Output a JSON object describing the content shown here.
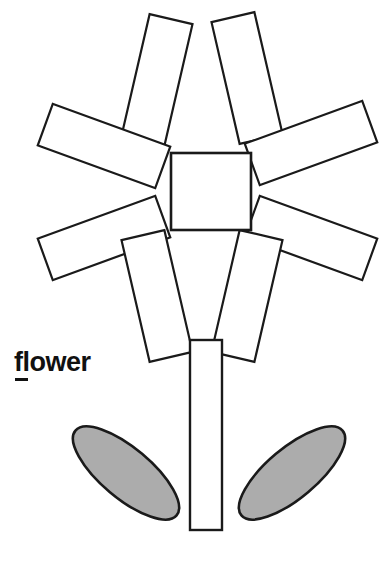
{
  "page": {
    "title": "flower",
    "background_color": "#ffffff",
    "width": 381,
    "height": 565
  },
  "label": {
    "text": "flower",
    "color": "#111111",
    "underlined_letter": "f",
    "style": "bold-sans-serif"
  },
  "drawing": {
    "name": "flower-line-drawing",
    "stroke_color": "#1a1a1a",
    "stroke_width": 2.2,
    "petal_fill": "#ffffff",
    "center_fill": "#ffffff",
    "stem_fill": "#ffffff",
    "leaf_fill": "#acacac",
    "petal_count": 8,
    "center": {
      "shape": "square",
      "x": 171,
      "y": 153,
      "width": 80,
      "height": 77
    },
    "petals": [
      {
        "name": "petal-top-left",
        "cx": 157,
        "cy": 80,
        "w": 44,
        "h": 125,
        "rotate": 13
      },
      {
        "name": "petal-top-right",
        "cx": 247,
        "cy": 78,
        "w": 44,
        "h": 125,
        "rotate": -13
      },
      {
        "name": "petal-upper-left",
        "cx": 104,
        "cy": 146,
        "w": 125,
        "h": 44,
        "rotate": 20
      },
      {
        "name": "petal-upper-right",
        "cx": 311,
        "cy": 143,
        "w": 125,
        "h": 44,
        "rotate": -20
      },
      {
        "name": "petal-lower-left",
        "cx": 104,
        "cy": 238,
        "w": 125,
        "h": 44,
        "rotate": -20
      },
      {
        "name": "petal-lower-right",
        "cx": 311,
        "cy": 238,
        "w": 125,
        "h": 44,
        "rotate": 20
      },
      {
        "name": "petal-bottom-left",
        "cx": 157,
        "cy": 296,
        "w": 44,
        "h": 125,
        "rotate": -13
      },
      {
        "name": "petal-bottom-right",
        "cx": 247,
        "cy": 296,
        "w": 44,
        "h": 125,
        "rotate": 13
      }
    ],
    "stem": {
      "name": "stem",
      "x": 190,
      "y": 340,
      "width": 32,
      "height": 190
    },
    "leaves": [
      {
        "name": "leaf-left",
        "cx": 126,
        "cy": 473,
        "rx": 66,
        "ry": 25,
        "rotate": 40
      },
      {
        "name": "leaf-right",
        "cx": 292,
        "cy": 473,
        "rx": 66,
        "ry": 25,
        "rotate": -40
      }
    ]
  }
}
